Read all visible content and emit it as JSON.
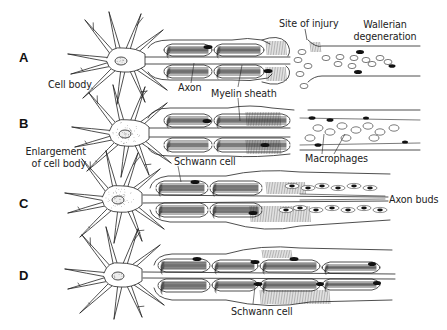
{
  "figure": {
    "stages": [
      {
        "id": "A",
        "label": "A"
      },
      {
        "id": "B",
        "label": "B"
      },
      {
        "id": "C",
        "label": "C"
      },
      {
        "id": "D",
        "label": "D"
      }
    ],
    "annotations": {
      "cell_body": "Cell body",
      "axon": "Axon",
      "myelin_sheath": "Myelin sheath",
      "site_of_injury": "Site of injury",
      "wallerian_1": "Wallerian",
      "wallerian_2": "degeneration",
      "enlargement_1": "Enlargement",
      "enlargement_2": "of cell body",
      "schwann_cell_top": "Schwann cell",
      "macrophages": "Macrophages",
      "axon_buds": "Axon buds",
      "schwann_cell_bottom": "Schwann cell"
    },
    "colors": {
      "ink": "#222222",
      "background": "#ffffff",
      "nucleus": "#111111"
    }
  }
}
